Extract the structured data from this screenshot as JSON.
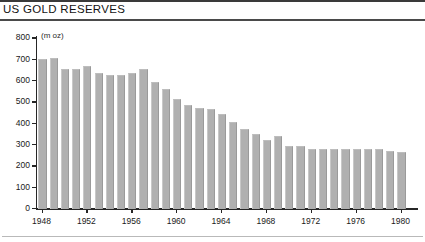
{
  "header": {
    "title": "US GOLD RESERVES"
  },
  "chart_data": {
    "type": "bar",
    "title": "US GOLD RESERVES",
    "xlabel": "",
    "ylabel": "(m oz)",
    "unit_label": "(m oz)",
    "ylim": [
      0,
      800
    ],
    "yticks": [
      0,
      100,
      200,
      300,
      400,
      500,
      600,
      700,
      800
    ],
    "ytick_labels": [
      "0",
      "100",
      "200",
      "300",
      "400",
      "500",
      "600",
      "700",
      "800"
    ],
    "xlim": [
      1948,
      1980
    ],
    "xticks": [
      1948,
      1952,
      1956,
      1960,
      1964,
      1968,
      1972,
      1976,
      1980
    ],
    "xtick_labels": [
      "1948",
      "1952",
      "1956",
      "1960",
      "1964",
      "1968",
      "1972",
      "1976",
      "1980"
    ],
    "grid": false,
    "legend": null,
    "bar_color": "#b0b0b0",
    "categories": [
      "1948",
      "1949",
      "1950",
      "1951",
      "1952",
      "1953",
      "1954",
      "1955",
      "1956",
      "1957",
      "1958",
      "1959",
      "1960",
      "1961",
      "1962",
      "1963",
      "1964",
      "1965",
      "1966",
      "1967",
      "1968",
      "1969",
      "1970",
      "1971",
      "1972",
      "1973",
      "1974",
      "1975",
      "1976",
      "1977",
      "1978",
      "1979",
      "1980"
    ],
    "values": [
      697,
      702,
      652,
      653,
      664,
      631,
      622,
      622,
      631,
      653,
      591,
      559,
      509,
      484,
      467,
      466,
      442,
      401,
      370,
      345,
      317,
      339,
      291,
      291,
      276,
      276,
      276,
      275,
      275,
      278,
      277,
      265,
      264
    ]
  }
}
